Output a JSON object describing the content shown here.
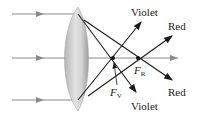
{
  "diagram": {
    "labels": {
      "violet_top": "Violet",
      "violet_bottom": "Violet",
      "red_top": "Red",
      "red_bottom": "Red",
      "focal_violet_main": "F",
      "focal_violet_sub": "V",
      "focal_red_main": "F",
      "focal_red_sub": "R"
    },
    "colors": {
      "incoming_ray": "#8a8a8a",
      "refracted_ray": "#1a1a1a",
      "lens_fill": "#c9c9c9",
      "lens_edge": "#a8a8a8"
    }
  }
}
